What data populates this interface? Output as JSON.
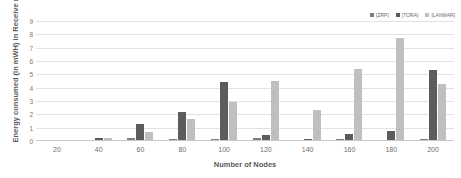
{
  "chart_data": {
    "type": "bar",
    "title": "",
    "xlabel": "Number of Nodes",
    "ylabel": "Energy consumed (in mWH) in Receive mode",
    "categories": [
      "20",
      "40",
      "60",
      "80",
      "100",
      "120",
      "140",
      "160",
      "180",
      "200"
    ],
    "ylim": [
      0,
      9
    ],
    "yticks": [
      "0",
      "1",
      "2",
      "3",
      "4",
      "5",
      "6",
      "7",
      "8",
      "9"
    ],
    "grid": true,
    "legend_position": "top-right",
    "series": [
      {
        "name": "[ZRP]",
        "color": "#7f7f7f",
        "values": [
          0.03,
          0.06,
          0.2,
          0.15,
          0.12,
          0.25,
          0.1,
          0.12,
          0.1,
          0.12
        ]
      },
      {
        "name": "[TORA]",
        "color": "#5c5c5c",
        "values": [
          0.05,
          0.25,
          1.25,
          2.15,
          4.4,
          0.45,
          0.12,
          0.5,
          0.75,
          5.3
        ]
      },
      {
        "name": "[LANMAR]",
        "color": "#bfbfbf",
        "values": [
          0.04,
          0.2,
          0.7,
          1.65,
          2.9,
          4.5,
          2.3,
          5.4,
          7.7,
          4.3
        ]
      }
    ]
  }
}
